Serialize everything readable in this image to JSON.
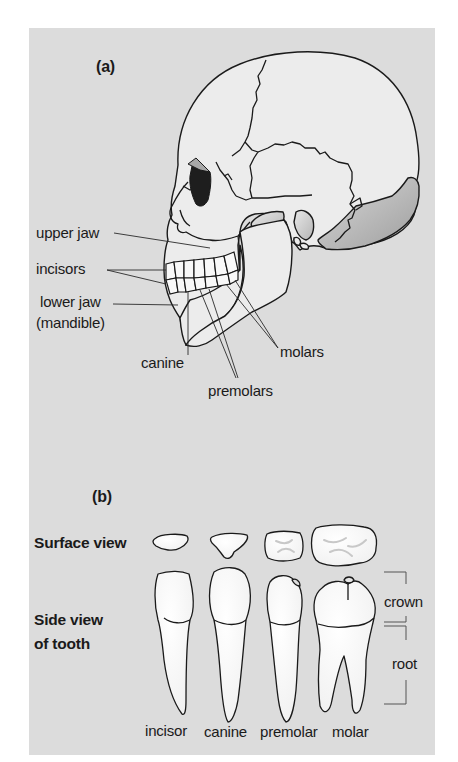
{
  "figure": {
    "part_a": {
      "label": "(a)",
      "subject": "human skull, side view",
      "labels": {
        "upper_jaw": "upper jaw",
        "incisors": "incisors",
        "lower_jaw_1": "lower jaw",
        "lower_jaw_2": "(mandible)",
        "canine": "canine",
        "premolars": "premolars",
        "molars": "molars"
      }
    },
    "part_b": {
      "label": "(b)",
      "row_labels": {
        "surface_view": "Surface view",
        "side_view_1": "Side view",
        "side_view_2": "of tooth"
      },
      "tooth_types": [
        "incisor",
        "canine",
        "premolar",
        "molar"
      ],
      "brackets": {
        "crown": "crown",
        "root": "root"
      }
    },
    "colors": {
      "background": "#dcdcdc",
      "bone": "#ececec",
      "outline": "#1a1a1a",
      "shade": "#a8a8a8",
      "orbit": "#1e1e1e"
    }
  }
}
